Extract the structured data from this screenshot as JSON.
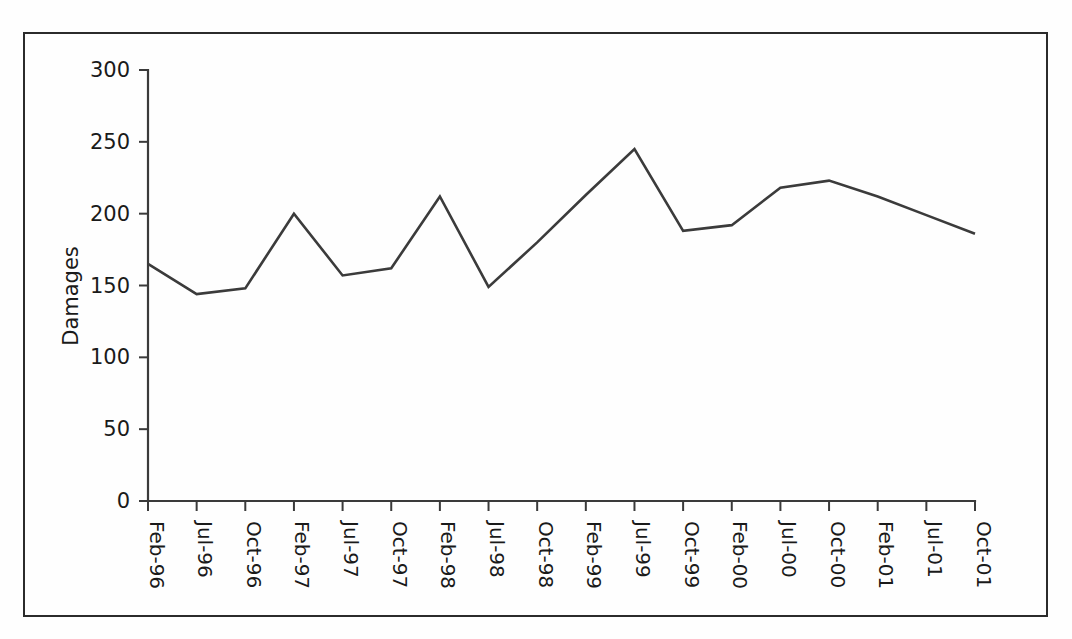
{
  "figure": {
    "background_color": "#fefefe",
    "frame_color": "#2b2b2b",
    "axis_color": "#3a3a3a",
    "line_color": "#3b3b3b"
  },
  "chart_data": {
    "type": "line",
    "title": "",
    "xlabel": "",
    "ylabel": "Damages",
    "ylim": [
      0,
      300
    ],
    "yticks": [
      0,
      50,
      100,
      150,
      200,
      250,
      300
    ],
    "ytick_labels": [
      "0",
      "50",
      "100",
      "150",
      "200",
      "250",
      "300"
    ],
    "grid": false,
    "legend": false,
    "categories": [
      "Feb-96",
      "Jul-96",
      "Oct-96",
      "Feb-97",
      "Jul-97",
      "Oct-97",
      "Feb-98",
      "Jul-98",
      "Oct-98",
      "Feb-99",
      "Jul-99",
      "Oct-99",
      "Feb-00",
      "Jul-00",
      "Oct-00",
      "Feb-01",
      "Jul-01",
      "Oct-01"
    ],
    "series": [
      {
        "name": "Damages",
        "values": [
          165,
          144,
          148,
          200,
          157,
          162,
          212,
          149,
          180,
          213,
          245,
          188,
          192,
          218,
          223,
          212,
          199,
          186
        ]
      }
    ]
  }
}
